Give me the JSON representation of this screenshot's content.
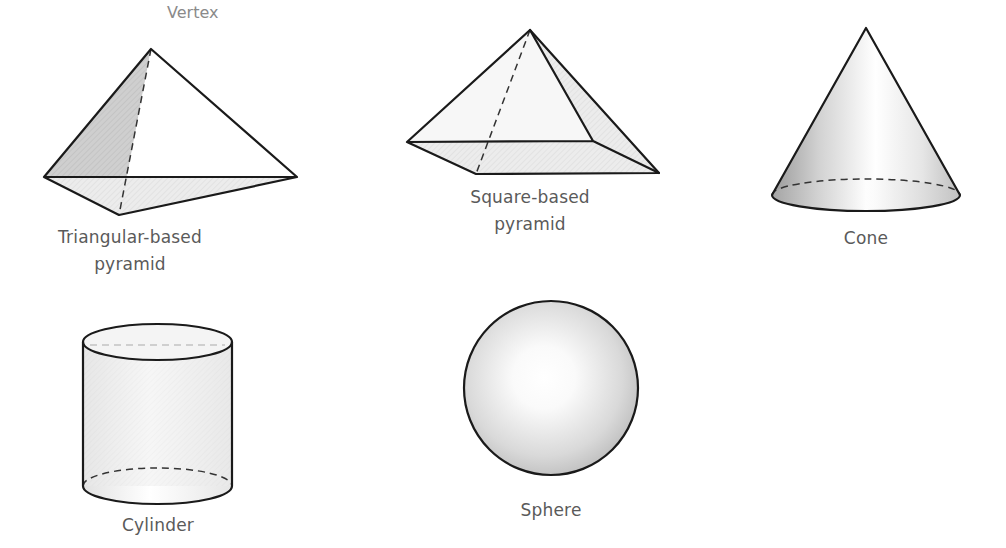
{
  "diagram": {
    "colors": {
      "edge": "#1a1a1a",
      "label": "#5a5a5a",
      "vertex_label": "#8a8a8a",
      "face_shade": "#c8c8c8",
      "face_light": "#ffffff"
    },
    "shapes": [
      {
        "id": "triangular-pyramid",
        "label_line1": "Triangular-based",
        "label_line2": "pyramid",
        "annotation": "Vertex"
      },
      {
        "id": "square-pyramid",
        "label_line1": "Square-based",
        "label_line2": "pyramid"
      },
      {
        "id": "cone",
        "label_line1": "Cone"
      },
      {
        "id": "cylinder",
        "label_line1": "Cylinder"
      },
      {
        "id": "sphere",
        "label_line1": "Sphere"
      }
    ]
  }
}
